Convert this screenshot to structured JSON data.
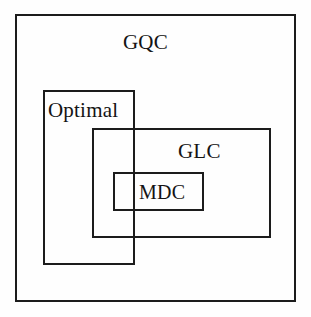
{
  "diagram": {
    "type": "nested-venn-set-diagram",
    "background_color": "#fefefe",
    "line_color": "#1c1c1c",
    "text_color": "#141414",
    "sets": [
      {
        "id": "gqc",
        "label": "GQC",
        "role": "outermost-universe",
        "rect": {
          "x": 15,
          "y": 14,
          "width": 281,
          "height": 288
        },
        "label_position": "top-center"
      },
      {
        "id": "optimal",
        "label": "Optimal",
        "role": "overlapping-subset",
        "rect": {
          "x": 43,
          "y": 90,
          "width": 92,
          "height": 175
        },
        "label_position": "top-left"
      },
      {
        "id": "glc",
        "label": "GLC",
        "role": "overlapping-subset",
        "rect": {
          "x": 92,
          "y": 128,
          "width": 179,
          "height": 110
        },
        "label_position": "top-right"
      },
      {
        "id": "mdc",
        "label": "MDC",
        "role": "innermost-subset",
        "rect": {
          "x": 113,
          "y": 172,
          "width": 91,
          "height": 39
        },
        "label_position": "center-right"
      }
    ],
    "containment": [
      "GQC contains Optimal",
      "GQC contains GLC",
      "GLC contains MDC",
      "Optimal partially overlaps GLC",
      "Optimal partially overlaps MDC"
    ]
  }
}
